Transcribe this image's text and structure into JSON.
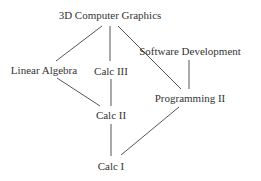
{
  "diagram": {
    "type": "hasse-diagram",
    "line_color": "#555555",
    "text_color": "#333333",
    "nodes": [
      {
        "id": "cg",
        "label": "3D Computer Graphics",
        "x": 110,
        "y": 15
      },
      {
        "id": "sd",
        "label": "Software Development",
        "x": 190,
        "y": 51
      },
      {
        "id": "la",
        "label": "Linear Algebra",
        "x": 44,
        "y": 70
      },
      {
        "id": "c3",
        "label": "Calc III",
        "x": 111,
        "y": 71
      },
      {
        "id": "p2",
        "label": "Programming II",
        "x": 190,
        "y": 98
      },
      {
        "id": "c2",
        "label": "Calc II",
        "x": 111,
        "y": 115
      },
      {
        "id": "c1",
        "label": "Calc I",
        "x": 111,
        "y": 166
      }
    ],
    "edges": [
      {
        "from": "cg",
        "to": "la",
        "x1": 102,
        "y1": 26,
        "x2": 56,
        "y2": 61
      },
      {
        "from": "cg",
        "to": "c3",
        "x1": 110,
        "y1": 26,
        "x2": 110,
        "y2": 61
      },
      {
        "from": "cg",
        "to": "p2",
        "x1": 118,
        "y1": 26,
        "x2": 181,
        "y2": 89
      },
      {
        "from": "sd",
        "to": "p2",
        "x1": 189,
        "y1": 60,
        "x2": 189,
        "y2": 89
      },
      {
        "from": "la",
        "to": "c2",
        "x1": 57,
        "y1": 78,
        "x2": 100,
        "y2": 106
      },
      {
        "from": "c3",
        "to": "c2",
        "x1": 111,
        "y1": 79,
        "x2": 111,
        "y2": 106
      },
      {
        "from": "c2",
        "to": "c1",
        "x1": 111,
        "y1": 124,
        "x2": 111,
        "y2": 156
      },
      {
        "from": "p2",
        "to": "c1",
        "x1": 179,
        "y1": 107,
        "x2": 121,
        "y2": 155
      }
    ]
  }
}
